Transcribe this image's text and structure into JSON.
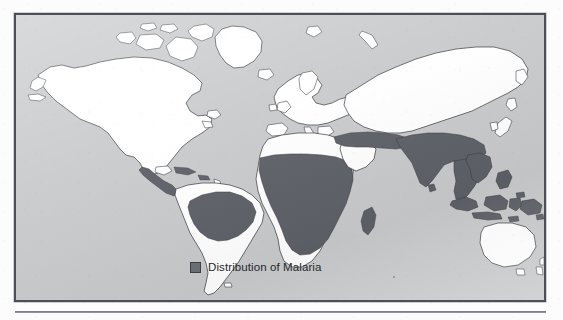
{
  "figure": {
    "kind": "world-map",
    "projection": "robinson",
    "frame_border_color": "#4c4f55",
    "ocean_color": "#c9cacc",
    "land_color": "#ffffff",
    "coastline_color": "#31343a",
    "highlight_color": "#5d6167",
    "page_background": "#fcfcfc"
  },
  "legend": {
    "label": "Distribution of Malaria",
    "swatch_color": "#6a6e74",
    "swatch_border_color": "#3c3f45"
  },
  "map_content": {
    "title": "Distribution of Malaria",
    "highlighted_regions": [
      "Central America",
      "Northern South America (Amazon Basin)",
      "Sub-Saharan Africa",
      "Madagascar",
      "Middle East and Arabian fringe",
      "Iran and Afghanistan",
      "Indian Subcontinent",
      "Southeast Asia",
      "Southern China",
      "Indonesia",
      "Philippines",
      "New Guinea"
    ],
    "unhighlighted_regions": [
      "North America",
      "Greenland",
      "Europe",
      "North Africa",
      "Southern Africa",
      "Southern South America",
      "Australia",
      "Japan",
      "Northern Asia (Russia)"
    ]
  }
}
